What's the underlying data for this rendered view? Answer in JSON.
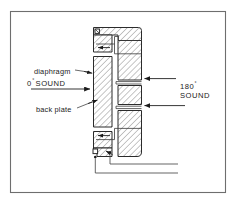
{
  "figure": {
    "type": "technical-cross-section-diagram",
    "frame": {
      "border_color": "#6e6e6e",
      "background": "#ffffff"
    },
    "line_color": "#2b2b2b",
    "hatch_color": "#4a4a4a",
    "labels": {
      "diaphragm": "diaphragm",
      "back_plate": "back plate",
      "sound_front_value": "0",
      "sound_front_degree": "°",
      "sound_front_word": "SOUND",
      "sound_rear_value": "180",
      "sound_rear_degree": "°",
      "sound_rear_word": "SOUND"
    },
    "annotations": {
      "front_sound_arrow_direction": "right",
      "rear_sound_arrow_upper_direction": "left",
      "rear_sound_arrow_lower_direction": "left",
      "internal_channel_arrow_upper_direction": "left",
      "internal_channel_arrow_lower_direction": "left",
      "terminal_count": "2",
      "lead_wire_count": "2"
    }
  }
}
